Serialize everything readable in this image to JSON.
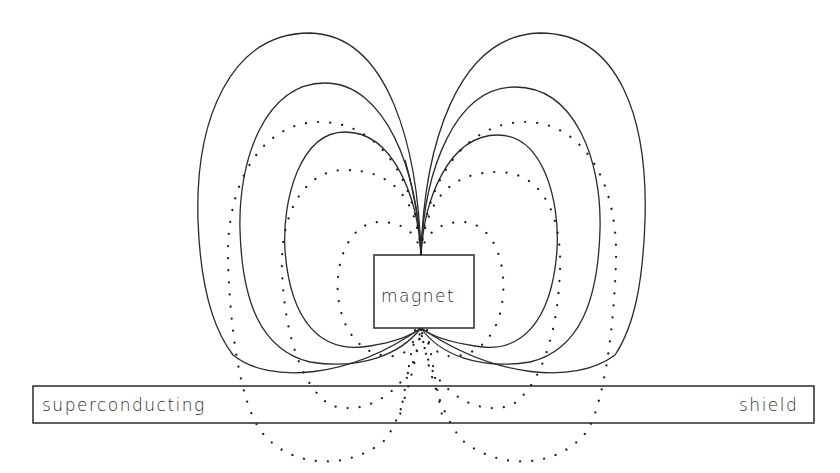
{
  "diagram": {
    "title": "",
    "magnet": {
      "label": "magnet"
    },
    "shield": {
      "label_left": "superconducting",
      "label_right": "shield"
    },
    "legend": [],
    "line_styles": {
      "solid": "field lines of magnet with superconducting shield",
      "dotted": "field lines of free dipole / image"
    },
    "colors": {
      "stroke": "#2a2a2a",
      "background": "#ffffff"
    }
  }
}
